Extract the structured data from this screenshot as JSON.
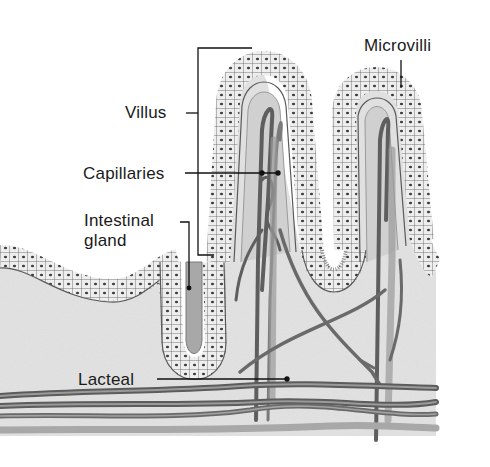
{
  "diagram": {
    "labels": {
      "villus": "Villus",
      "capillaries": "Capillaries",
      "intestinal_gland_line1": "Intestinal",
      "intestinal_gland_line2": "gland",
      "lacteal": "Lacteal",
      "microvilli": "Microvilli"
    },
    "colors": {
      "background": "#ffffff",
      "tissue": "#e2e2e2",
      "cell_fill": "#ededed",
      "cell_outline": "#555555",
      "nucleus": "#444444",
      "brush_border": "#8a8a8a",
      "vessel_dark": "#5e5e5e",
      "vessel_mid": "#8c8c8c",
      "vessel_light": "#a8a8a8",
      "leader_line": "#111111",
      "text": "#1a1a1a"
    }
  }
}
